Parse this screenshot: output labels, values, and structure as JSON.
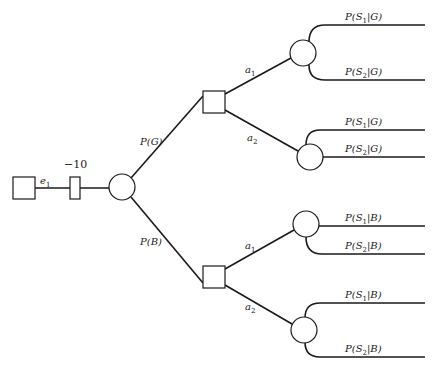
{
  "diagram": {
    "type": "decision-tree",
    "root": {
      "label": "e_1",
      "display": "e1",
      "node": "decision"
    },
    "cost": {
      "value": "−10"
    },
    "chance_root": {
      "branches": [
        {
          "label": "P(G)",
          "node": "decision",
          "actions": [
            {
              "label": "a1",
              "outcomes": [
                "P(S1|G)",
                "P(S2|G)"
              ]
            },
            {
              "label": "a2",
              "outcomes": [
                "P(S1|G)",
                "P(S2|G)"
              ]
            }
          ]
        },
        {
          "label": "P(B)",
          "node": "decision",
          "actions": [
            {
              "label": "a1",
              "outcomes": [
                "P(S1|B)",
                "P(S2|B)"
              ]
            },
            {
              "label": "a2",
              "outcomes": [
                "P(S1|B)",
                "P(S2|B)"
              ]
            }
          ]
        }
      ]
    }
  },
  "labels": {
    "e1_main": "e",
    "e1_sub": "1",
    "cost": "−10",
    "pG": "P(G)",
    "pB": "P(B)",
    "a": "a",
    "one": "1",
    "two": "2",
    "P": "P(S",
    "G": "|G)",
    "B": "|B)"
  }
}
